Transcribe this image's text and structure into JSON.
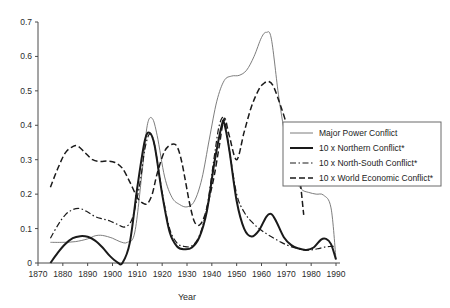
{
  "chart_data": {
    "type": "line",
    "title": "",
    "xlabel": "Year",
    "ylabel": "",
    "xlim": [
      1870,
      1990
    ],
    "ylim": [
      0,
      0.7
    ],
    "grid": false,
    "legend_position": "right-middle",
    "x_ticks": [
      1870,
      1880,
      1890,
      1900,
      1910,
      1920,
      1930,
      1940,
      1950,
      1960,
      1970,
      1980,
      1990
    ],
    "y_ticks": [
      0,
      0.1,
      0.2,
      0.3,
      0.4,
      0.5,
      0.6,
      0.7
    ],
    "x_tick_labels": [
      "1870",
      "1880",
      "1890",
      "1900",
      "1910",
      "1920",
      "1930",
      "1940",
      "1950",
      "1960",
      "1970",
      "1980",
      "1990"
    ],
    "y_tick_labels": [
      "0",
      "0.1",
      "0.2",
      "0.3",
      "0.4",
      "0.5",
      "0.6",
      "0.7"
    ],
    "series": [
      {
        "name": "Major Power Conflict",
        "style": "solid-thin",
        "color": "#6e6e6e",
        "width": 0.9,
        "x": [
          1875,
          1880,
          1885,
          1890,
          1893,
          1896,
          1900,
          1903,
          1906,
          1909,
          1912,
          1914,
          1916,
          1918,
          1921,
          1924,
          1927,
          1930,
          1933,
          1936,
          1939,
          1942,
          1945,
          1948,
          1951,
          1954,
          1957,
          1960,
          1962,
          1964,
          1967,
          1970,
          1973,
          1976,
          1979,
          1982,
          1985,
          1988,
          1990
        ],
        "y": [
          0.06,
          0.06,
          0.062,
          0.07,
          0.079,
          0.08,
          0.072,
          0.062,
          0.06,
          0.09,
          0.27,
          0.4,
          0.42,
          0.37,
          0.25,
          0.19,
          0.17,
          0.163,
          0.18,
          0.245,
          0.36,
          0.47,
          0.53,
          0.543,
          0.545,
          0.56,
          0.6,
          0.655,
          0.67,
          0.65,
          0.48,
          0.35,
          0.255,
          0.215,
          0.205,
          0.2,
          0.197,
          0.16,
          0.01
        ]
      },
      {
        "name": "10 x Northern Conflict*",
        "style": "solid-thick",
        "color": "#1a1a1a",
        "width": 2.0,
        "x": [
          1875,
          1878,
          1881,
          1884,
          1887,
          1890,
          1893,
          1896,
          1899,
          1902,
          1904,
          1907,
          1910,
          1913,
          1915,
          1917,
          1920,
          1923,
          1926,
          1929,
          1932,
          1935,
          1938,
          1941,
          1944,
          1945,
          1947,
          1950,
          1953,
          1956,
          1959,
          1962,
          1964,
          1966,
          1969,
          1972,
          1975,
          1978,
          1981,
          1984,
          1986,
          1988,
          1990
        ],
        "y": [
          0.0,
          0.03,
          0.055,
          0.072,
          0.078,
          0.076,
          0.065,
          0.045,
          0.02,
          0.002,
          0.0,
          0.06,
          0.22,
          0.355,
          0.378,
          0.34,
          0.2,
          0.09,
          0.048,
          0.04,
          0.045,
          0.075,
          0.15,
          0.29,
          0.4,
          0.405,
          0.33,
          0.18,
          0.1,
          0.077,
          0.095,
          0.135,
          0.142,
          0.12,
          0.075,
          0.052,
          0.042,
          0.038,
          0.045,
          0.068,
          0.07,
          0.055,
          0.01
        ]
      },
      {
        "name": "10 x North-South Conflict*",
        "style": "dashdot",
        "color": "#1a1a1a",
        "width": 1.2,
        "x": [
          1875,
          1878,
          1881,
          1884,
          1887,
          1890,
          1893,
          1896,
          1899,
          1902,
          1905,
          1908,
          1911,
          1913,
          1915,
          1917,
          1920,
          1923,
          1926,
          1929,
          1932,
          1935,
          1938,
          1941,
          1943,
          1945,
          1947,
          1950,
          1953,
          1956,
          1959,
          1962,
          1965,
          1968,
          1971,
          1974,
          1977,
          1980,
          1983,
          1986,
          1988,
          1990
        ],
        "y": [
          0.072,
          0.11,
          0.14,
          0.155,
          0.158,
          0.148,
          0.135,
          0.128,
          0.122,
          0.112,
          0.105,
          0.13,
          0.23,
          0.33,
          0.375,
          0.34,
          0.205,
          0.1,
          0.058,
          0.048,
          0.05,
          0.08,
          0.16,
          0.31,
          0.4,
          0.418,
          0.33,
          0.2,
          0.148,
          0.12,
          0.1,
          0.085,
          0.072,
          0.06,
          0.05,
          0.043,
          0.038,
          0.038,
          0.042,
          0.047,
          0.048,
          0.048
        ]
      },
      {
        "name": "10 x World Economic Conflict*",
        "style": "dashed",
        "color": "#1a1a1a",
        "width": 1.5,
        "x": [
          1875,
          1878,
          1881,
          1884,
          1886,
          1889,
          1892,
          1895,
          1898,
          1901,
          1904,
          1907,
          1910,
          1912,
          1914,
          1916,
          1918,
          1921,
          1924,
          1926,
          1928,
          1931,
          1933,
          1935,
          1937,
          1939,
          1941,
          1943,
          1945,
          1947,
          1950,
          1953,
          1956,
          1959,
          1961,
          1963,
          1965,
          1968,
          1971,
          1974,
          1977
        ],
        "y": [
          0.22,
          0.275,
          0.32,
          0.338,
          0.34,
          0.32,
          0.3,
          0.295,
          0.296,
          0.292,
          0.275,
          0.235,
          0.19,
          0.175,
          0.172,
          0.2,
          0.26,
          0.325,
          0.345,
          0.338,
          0.29,
          0.175,
          0.12,
          0.11,
          0.135,
          0.19,
          0.255,
          0.34,
          0.42,
          0.37,
          0.3,
          0.38,
          0.455,
          0.505,
          0.522,
          0.527,
          0.51,
          0.45,
          0.385,
          0.33,
          0.14
        ]
      }
    ],
    "legend": {
      "entries": [
        {
          "label": "Major Power Conflict",
          "style": "solid-thin"
        },
        {
          "label": "10 x Northern Conflict*",
          "style": "solid-thick"
        },
        {
          "label": "10 x North-South Conflict*",
          "style": "dashdot"
        },
        {
          "label": "10 x World Economic Conflict*",
          "style": "dashed"
        }
      ]
    }
  }
}
